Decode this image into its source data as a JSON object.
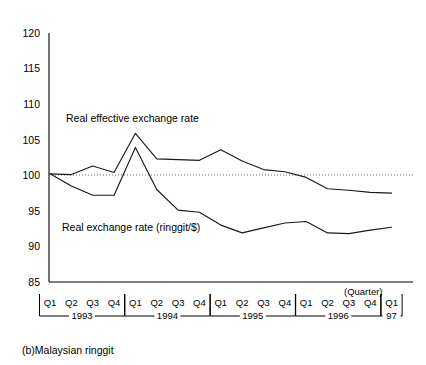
{
  "caption": "(b)Malaysian ringgit",
  "axis_note": "(Quarter)",
  "colors": {
    "line": "#1a1a1a",
    "axis": "#000000",
    "reference": "#555555",
    "background": "#ffffff"
  },
  "y_ticks": [
    "120",
    "115",
    "110",
    "105",
    "100",
    "95",
    "90",
    "85"
  ],
  "quarter_labels": [
    "Q1",
    "Q2",
    "Q3",
    "Q4",
    "Q1",
    "Q2",
    "Q3",
    "Q4",
    "Q1",
    "Q2",
    "Q3",
    "Q4",
    "Q1",
    "Q2",
    "Q3",
    "Q4",
    "Q1"
  ],
  "year_groups": [
    {
      "label": "1993",
      "start": 0,
      "end": 3
    },
    {
      "label": "1994",
      "start": 4,
      "end": 7
    },
    {
      "label": "1995",
      "start": 8,
      "end": 11
    },
    {
      "label": "1996",
      "start": 12,
      "end": 15
    },
    {
      "label": "97",
      "start": 16,
      "end": 16
    }
  ],
  "series_labels": {
    "effective": "Real effective exchange rate",
    "bilateral": "Real exchange rate (ringgit/$)"
  },
  "chart_data": {
    "type": "line",
    "title": "(b)Malaysian ringgit",
    "xlabel": "(Quarter)",
    "ylabel": "",
    "ylim": [
      85,
      120
    ],
    "yticks": [
      85,
      90,
      95,
      100,
      105,
      110,
      115,
      120
    ],
    "grid": false,
    "reference_line": {
      "value": 100,
      "style": "dotted"
    },
    "legend": "inline-annotation",
    "x": [
      "1993 Q1",
      "1993 Q2",
      "1993 Q3",
      "1993 Q4",
      "1994 Q1",
      "1994 Q2",
      "1994 Q3",
      "1994 Q4",
      "1995 Q1",
      "1995 Q2",
      "1995 Q3",
      "1995 Q4",
      "1996 Q1",
      "1996 Q2",
      "1996 Q3",
      "1996 Q4",
      "1997 Q1"
    ],
    "series": [
      {
        "name": "Real effective exchange rate",
        "values": [
          100.2,
          100.1,
          101.3,
          100.4,
          105.9,
          102.3,
          102.2,
          102.1,
          103.6,
          102.0,
          100.8,
          100.5,
          99.7,
          98.1,
          97.9,
          97.6,
          97.5
        ]
      },
      {
        "name": "Real exchange rate (ringgit/$)",
        "values": [
          100.2,
          98.5,
          97.2,
          97.2,
          103.9,
          98.0,
          95.1,
          94.8,
          93.0,
          91.9,
          92.6,
          93.3,
          93.5,
          91.9,
          91.8,
          92.3,
          92.7
        ]
      }
    ]
  }
}
